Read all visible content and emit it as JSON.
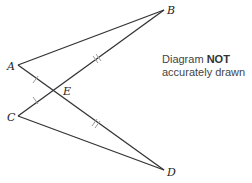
{
  "diagram": {
    "points": {
      "A": {
        "label": "A",
        "x": 18,
        "y": 65
      },
      "B": {
        "label": "B",
        "x": 164,
        "y": 10
      },
      "C": {
        "label": "C",
        "x": 18,
        "y": 116
      },
      "D": {
        "label": "D",
        "x": 164,
        "y": 170
      },
      "E": {
        "label": "E",
        "x": 55,
        "y": 90
      }
    },
    "segments": [
      [
        "A",
        "B"
      ],
      [
        "A",
        "D"
      ],
      [
        "C",
        "B"
      ],
      [
        "C",
        "D"
      ]
    ],
    "marks": {
      "single_tick": [
        "AE",
        "CE"
      ],
      "double_tick": [
        "EB",
        "ED"
      ]
    },
    "note": {
      "prefix": "Diagram ",
      "emphasis": "NOT",
      "line2": "accurately drawn"
    },
    "colors": {
      "line": "#333333",
      "tick": "#999999"
    }
  }
}
